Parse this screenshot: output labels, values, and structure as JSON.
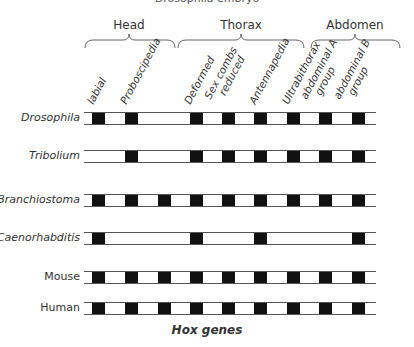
{
  "caption": "Drosophila embryo",
  "regions": [
    {
      "label": "Head",
      "center": 129,
      "start": 85,
      "end": 175
    },
    {
      "label": "Thorax",
      "center": 241,
      "start": 178,
      "end": 304
    },
    {
      "label": "Abdomen",
      "center": 355,
      "start": 311,
      "end": 400
    }
  ],
  "genes": [
    {
      "label": "labial",
      "x": 92
    },
    {
      "label": "Proboscipedia",
      "x": 125
    },
    {
      "label": "",
      "x": 158
    },
    {
      "label": "Deformed",
      "x": 190
    },
    {
      "label": "Sex combs reduced",
      "x": 222
    },
    {
      "label": "Antennapedia",
      "x": 254
    },
    {
      "label": "Ultrabithorax",
      "x": 287
    },
    {
      "label": "abdominal A group",
      "x": 319
    },
    {
      "label": "abdominal B group",
      "x": 352
    }
  ],
  "column_labels": [
    {
      "lines": [
        "labial"
      ],
      "x": 95
    },
    {
      "lines": [
        "Proboscipedia"
      ],
      "x": 128
    },
    {
      "lines": [
        "Deformed"
      ],
      "x": 192
    },
    {
      "lines": [
        "Sex combs",
        "reduced"
      ],
      "x": 222
    },
    {
      "lines": [
        "Antennapedia"
      ],
      "x": 257
    },
    {
      "lines": [
        "Ultrabithorax"
      ],
      "x": 290
    },
    {
      "lines": [
        "abdominal A",
        "group"
      ],
      "x": 318
    },
    {
      "lines": [
        "abdominal B",
        "group"
      ],
      "x": 351
    }
  ],
  "organisms": [
    {
      "name": "Drosophila",
      "italic": true,
      "top": 112,
      "present": [
        true,
        true,
        false,
        true,
        true,
        true,
        true,
        true,
        true
      ]
    },
    {
      "name": "Tribolium",
      "italic": true,
      "top": 150,
      "present": [
        false,
        true,
        false,
        true,
        true,
        true,
        true,
        true,
        true
      ]
    },
    {
      "name": "Branchiostoma",
      "italic": true,
      "top": 194,
      "present": [
        true,
        true,
        true,
        true,
        true,
        true,
        true,
        true,
        true
      ]
    },
    {
      "name": "Caenorhabditis",
      "italic": true,
      "top": 232,
      "present": [
        true,
        false,
        false,
        true,
        false,
        true,
        false,
        false,
        true
      ]
    },
    {
      "name": "Mouse",
      "italic": false,
      "top": 271,
      "present": [
        true,
        true,
        true,
        true,
        true,
        true,
        true,
        true,
        true
      ]
    },
    {
      "name": "Human",
      "italic": false,
      "top": 302,
      "present": [
        true,
        true,
        true,
        true,
        true,
        true,
        true,
        true,
        true
      ]
    }
  ],
  "footer": "Hox genes"
}
